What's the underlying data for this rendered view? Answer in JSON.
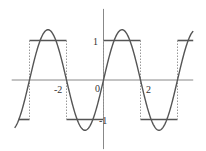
{
  "chart_data": {
    "type": "line",
    "title": "",
    "xlabel": "",
    "ylabel": "",
    "xlim": [
      -4.8,
      4.85
    ],
    "ylim": [
      -1.75,
      1.8
    ],
    "grid": false,
    "legend": "none",
    "x_ticks": [
      {
        "value": -2,
        "label": "-2"
      },
      {
        "value": 2,
        "label": "2"
      }
    ],
    "y_ticks": [
      {
        "value": 1,
        "label": "1"
      },
      {
        "value": -1,
        "label": "-1"
      }
    ],
    "origin_label": "0",
    "series": [
      {
        "name": "first-harmonic",
        "description": "(4/pi) * sin(pi*x/2)",
        "style": "solid",
        "color": "#555555",
        "amplitude": 1.273,
        "period": 4,
        "x_range": [
          -4.8,
          4.85
        ]
      },
      {
        "name": "square-wave",
        "description": "sign(sin(pi*x/2))",
        "style": "solid-levels-dotted-jumps",
        "color": "#555555",
        "levels": [
          1,
          -1
        ],
        "jumps_at": [
          -4,
          -2,
          0,
          2,
          4
        ],
        "segments": [
          {
            "x": [
              -4.6,
              -4
            ],
            "y": -1
          },
          {
            "x": [
              -4,
              -2
            ],
            "y": 1
          },
          {
            "x": [
              -2,
              0
            ],
            "y": -1
          },
          {
            "x": [
              0,
              2
            ],
            "y": 1
          },
          {
            "x": [
              2,
              4
            ],
            "y": -1
          },
          {
            "x": [
              4,
              4.85
            ],
            "y": 1
          }
        ]
      }
    ]
  }
}
